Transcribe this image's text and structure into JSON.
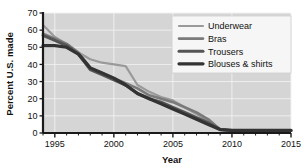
{
  "chart_data": {
    "type": "line",
    "title": "",
    "xlabel": "Year",
    "ylabel": "Percent U.S. made",
    "xlim": [
      1994,
      2015
    ],
    "ylim": [
      0,
      70
    ],
    "yticks": [
      0,
      10,
      20,
      30,
      40,
      50,
      60,
      70
    ],
    "xticks": [
      1995,
      2000,
      2005,
      2010,
      2015
    ],
    "xticklabels": [
      "1995",
      "2000",
      "2005",
      "2010",
      "2015"
    ],
    "yticklabels": [
      "0",
      "10",
      "20",
      "30",
      "40",
      "50",
      "60",
      "70"
    ],
    "grid": true,
    "legend_position": "upper right",
    "x": [
      1994,
      1995,
      1996,
      1997,
      1998,
      1999,
      2000,
      2001,
      2002,
      2003,
      2004,
      2005,
      2006,
      2007,
      2008,
      2009,
      2010,
      2011,
      2012,
      2013,
      2014,
      2015
    ],
    "series": [
      {
        "name": "Underwear",
        "color": "#9a9a9a",
        "width": 2.2,
        "values": [
          63,
          56,
          52,
          47,
          43,
          41,
          40,
          39,
          28,
          24,
          21,
          19,
          15,
          11,
          7,
          2,
          1.5,
          1.5,
          1.5,
          1.5,
          1.5,
          1.5
        ]
      },
      {
        "name": "Bras",
        "color": "#7a7a7a",
        "width": 2.6,
        "values": [
          58,
          55,
          52,
          47,
          38,
          35,
          32,
          29,
          26,
          22,
          20,
          18,
          15,
          12,
          8,
          2,
          1.5,
          1.5,
          1.5,
          1.5,
          1.5,
          1.5
        ]
      },
      {
        "name": "Trousers",
        "color": "#555555",
        "width": 3.0,
        "values": [
          57,
          54,
          51,
          46,
          37,
          34,
          31,
          28,
          23,
          20,
          18,
          15,
          12,
          9,
          6,
          2,
          1.5,
          1.5,
          1.5,
          1.5,
          1.5,
          1.5
        ]
      },
      {
        "name": "Blouses & shirts",
        "color": "#333333",
        "width": 3.2,
        "values": [
          51,
          51,
          50,
          46,
          38,
          35,
          32,
          28,
          23,
          20,
          17,
          14,
          11,
          8,
          5,
          2,
          1.5,
          1.5,
          1.5,
          1.5,
          1.5,
          1.5
        ]
      }
    ],
    "legend_entries": [
      {
        "label": "Underwear"
      },
      {
        "label": "Bras"
      },
      {
        "label": "Trousers"
      },
      {
        "label": "Blouses & shirts"
      }
    ],
    "plot_bg": "#d5d5d5",
    "grid_color": "#f2f2f2",
    "axis_color": "#1a1a1a"
  }
}
